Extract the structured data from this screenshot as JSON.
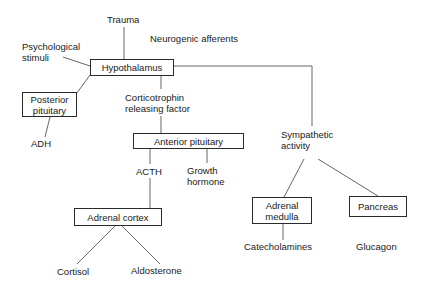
{
  "diagram": {
    "type": "stress-response flowchart",
    "inputs": {
      "trauma": "Trauma",
      "neurogenic": "Neurogenic afferents",
      "psychological_line1": "Psychological",
      "psychological_line2": "stimuli"
    },
    "nodes": {
      "hypothalamus": "Hypothalamus",
      "posterior_pituitary_line1": "Posterior",
      "posterior_pituitary_line2": "pituitary",
      "anterior_pituitary": "Anterior pituitary",
      "adrenal_cortex": "Adrenal cortex",
      "adrenal_medulla_line1": "Adrenal",
      "adrenal_medulla_line2": "medulla",
      "pancreas": "Pancreas"
    },
    "intermediates": {
      "crf_line1": "Corticotrophin",
      "crf_line2": "releasing factor",
      "acth": "ACTH",
      "growth_hormone_line1": "Growth",
      "growth_hormone_line2": "hormone",
      "sympathetic_line1": "Sympathetic",
      "sympathetic_line2": "activity"
    },
    "outputs": {
      "adh": "ADH",
      "cortisol": "Cortisol",
      "aldosterone": "Aldosterone",
      "catecholamines": "Catecholamines",
      "glucagon": "Glucagon"
    },
    "colors": {
      "line": "#555555",
      "border": "#2a2a2a",
      "text": "#1a1a1a",
      "background": "#ffffff"
    }
  }
}
